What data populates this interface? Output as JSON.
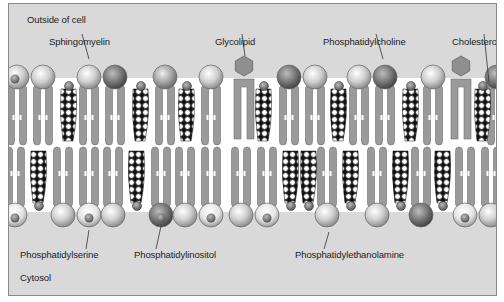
{
  "diagram": {
    "type": "lipid-bilayer-membrane",
    "regions": {
      "outside": "Outside of cell",
      "inside": "Cytosol"
    },
    "labels": {
      "sphingomyelin": "Sphingomyelin",
      "glycolipid": "Glycolipid",
      "phosphatidylcholine": "Phosphatidylcholine",
      "cholesterol": "Cholesterol",
      "phosphatidylserine": "Phosphatidylserine",
      "phosphatidylinositol": "Phosphatidylinositol",
      "phosphatidylethanolamine": "Phosphatidylethanolamine"
    },
    "outer_leaflet": {
      "heads": [
        {
          "x": 8,
          "kind": "inositol"
        },
        {
          "x": 34,
          "kind": "light"
        },
        {
          "x": 80,
          "kind": "light"
        },
        {
          "x": 106,
          "kind": "dark"
        },
        {
          "x": 156,
          "kind": "medium"
        },
        {
          "x": 202,
          "kind": "light"
        },
        {
          "x": 280,
          "kind": "dark"
        },
        {
          "x": 306,
          "kind": "light"
        },
        {
          "x": 350,
          "kind": "light"
        },
        {
          "x": 376,
          "kind": "dark"
        },
        {
          "x": 424,
          "kind": "light"
        },
        {
          "x": 488,
          "kind": "dark"
        }
      ],
      "glycolipids": [
        235,
        452
      ],
      "cholesterols": [
        60,
        132,
        178,
        255,
        330,
        402,
        474
      ]
    },
    "inner_leaflet": {
      "heads": [
        {
          "x": 6,
          "kind": "serine"
        },
        {
          "x": 54,
          "kind": "light"
        },
        {
          "x": 80,
          "kind": "serine"
        },
        {
          "x": 104,
          "kind": "light"
        },
        {
          "x": 152,
          "kind": "inositol-dark"
        },
        {
          "x": 176,
          "kind": "light"
        },
        {
          "x": 202,
          "kind": "serine"
        },
        {
          "x": 232,
          "kind": "light"
        },
        {
          "x": 258,
          "kind": "serine"
        },
        {
          "x": 318,
          "kind": "light"
        },
        {
          "x": 368,
          "kind": "light"
        },
        {
          "x": 412,
          "kind": "dark"
        },
        {
          "x": 456,
          "kind": "serine"
        },
        {
          "x": 482,
          "kind": "light"
        }
      ],
      "cholesterols": [
        30,
        128,
        282,
        300,
        342,
        392,
        434
      ]
    }
  }
}
